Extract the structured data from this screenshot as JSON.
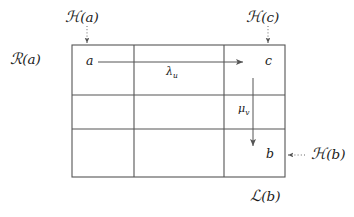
{
  "figure": {
    "width": 354,
    "height": 217,
    "background": "#ffffff",
    "line_color": "#555555",
    "text_color": "#1a1a1a",
    "grid": {
      "left": 72,
      "top": 45,
      "right": 285,
      "bottom": 177,
      "columns": 3,
      "rows": 3,
      "column_dividers": [
        134,
        224
      ],
      "row_dividers": [
        95,
        129
      ]
    }
  },
  "labels": {
    "h_of_a": {
      "cal": "ℋ",
      "arg": "(a)"
    },
    "h_of_c": {
      "cal": "ℋ",
      "arg": "(c)"
    },
    "h_of_b": {
      "cal": "ℋ",
      "arg": "(b)"
    },
    "r_of_a": {
      "cal": "ℛ",
      "arg": "(a)"
    },
    "l_of_b": {
      "cal": "ℒ",
      "arg": "(b)"
    }
  },
  "cells": {
    "a": "a",
    "c": "c",
    "b": "b"
  },
  "arrows": {
    "lambda_u": {
      "base": "λ",
      "sub": "u"
    },
    "mu_v": {
      "base": "μ",
      "sub": "v"
    }
  }
}
